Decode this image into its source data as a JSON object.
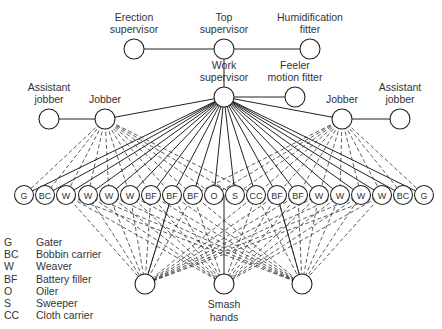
{
  "title_nodes": {
    "erection_supervisor": {
      "label": [
        "Erection",
        "supervisor"
      ],
      "x": 134,
      "y": 49
    },
    "top_supervisor": {
      "label": [
        "Top",
        "supervisor"
      ],
      "x": 224,
      "y": 49
    },
    "humidification_fitter": {
      "label": [
        "Humidification",
        "fitter"
      ],
      "x": 310,
      "y": 49
    },
    "work_supervisor": {
      "label": [
        "Work",
        "supervisor"
      ],
      "x": 224,
      "y": 97
    },
    "feeler_motion_fitter": {
      "label": [
        "Feeler",
        "motion fitter"
      ],
      "x": 295,
      "y": 97
    },
    "assistant_jobber_left": {
      "label": [
        "Assistant",
        "jobber"
      ],
      "x": 49,
      "y": 119
    },
    "jobber_left": {
      "label": [
        "Jobber"
      ],
      "x": 105,
      "y": 119
    },
    "jobber_right": {
      "label": [
        "Jobber"
      ],
      "x": 342,
      "y": 119
    },
    "assistant_jobber_right": {
      "label": [
        "Assistant",
        "jobber"
      ],
      "x": 400,
      "y": 119
    }
  },
  "worker_row": {
    "y": 195,
    "codes": [
      "G",
      "BC",
      "W",
      "W",
      "W",
      "W",
      "BF",
      "BF",
      "BF",
      "O",
      "S",
      "CC",
      "BF",
      "BF",
      "W",
      "W",
      "W",
      "W",
      "BC",
      "G"
    ],
    "x": [
      24,
      45,
      66,
      88,
      109,
      130,
      151,
      172,
      193,
      214,
      235,
      256,
      277,
      298,
      319,
      340,
      361,
      382,
      403,
      424
    ]
  },
  "bottom_nodes": [
    {
      "id": "smash_left",
      "x": 145,
      "y": 284,
      "label": []
    },
    {
      "id": "smash_center",
      "x": 224,
      "y": 284,
      "label": [
        "Smash",
        "hands"
      ]
    },
    {
      "id": "smash_right",
      "x": 302,
      "y": 284,
      "label": []
    }
  ],
  "legend": [
    {
      "code": "G",
      "name": "Gater"
    },
    {
      "code": "BC",
      "name": "Bobbin carrier"
    },
    {
      "code": "W",
      "name": "Weaver"
    },
    {
      "code": "BF",
      "name": "Battery filler"
    },
    {
      "code": "O",
      "name": "Oiler"
    },
    {
      "code": "S",
      "name": "Sweeper"
    },
    {
      "code": "CC",
      "name": "Cloth carrier"
    }
  ]
}
